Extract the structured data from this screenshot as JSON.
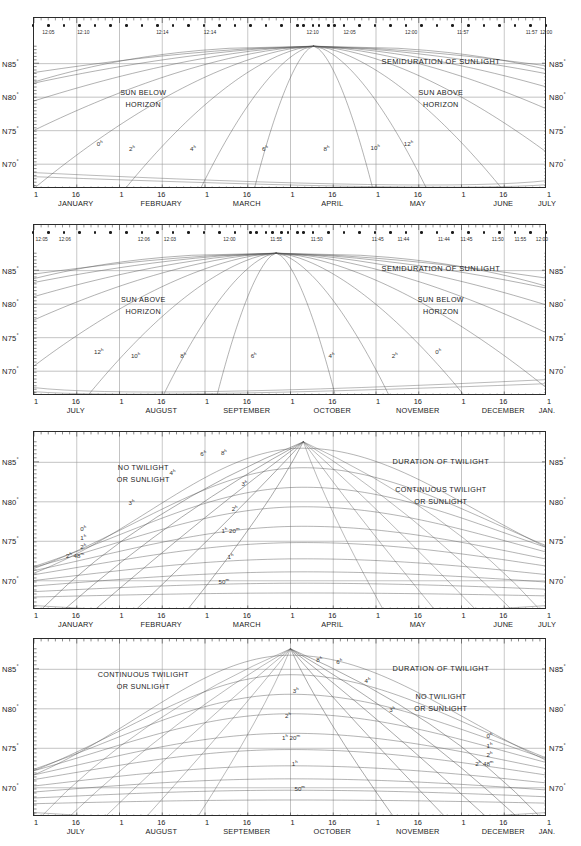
{
  "figure": {
    "width": 581,
    "height": 846,
    "background": "#ffffff",
    "line_color": "#555555",
    "axis_color": "#2b2b2b",
    "grid_color": "#9a9a9a"
  },
  "axis": {
    "y_ticks": [
      "N85",
      "N80",
      "N75",
      "N70"
    ],
    "degree_symbol": "°",
    "day_ticks": [
      "1",
      "16"
    ]
  },
  "panels": [
    {
      "id": "panel-1",
      "name": "semiduration-sunlight-jan-jul",
      "title": "SEMIDURATION OF SUNLIGHT",
      "left_region": [
        "SUN BELOW",
        "HORIZON"
      ],
      "right_region": [
        "SUN ABOVE",
        "HORIZON"
      ],
      "months": [
        "JANUARY",
        "FEBRUARY",
        "MARCH",
        "APRIL",
        "MAY",
        "JUNE"
      ],
      "end_month": "JULY",
      "time_labels": [
        {
          "text": "12:05",
          "x": 0.03
        },
        {
          "text": "12:10",
          "x": 0.098
        },
        {
          "text": "12:14",
          "x": 0.252
        },
        {
          "text": "12:14",
          "x": 0.345
        },
        {
          "text": "12:10",
          "x": 0.545
        },
        {
          "text": "12:05",
          "x": 0.617
        },
        {
          "text": "12:00",
          "x": 0.737
        },
        {
          "text": "11:57",
          "x": 0.838
        },
        {
          "text": "11:57",
          "x": 0.972
        },
        {
          "text": "12:00",
          "x": 1.06
        }
      ],
      "curve_labels": [
        {
          "text": "0",
          "sup": "h",
          "x": 0.13,
          "y": 0.735
        },
        {
          "text": "2",
          "sup": "h",
          "x": 0.193,
          "y": 0.765
        },
        {
          "text": "4",
          "sup": "h",
          "x": 0.312,
          "y": 0.765
        },
        {
          "text": "6",
          "sup": "h",
          "x": 0.452,
          "y": 0.765
        },
        {
          "text": "8",
          "sup": "h",
          "x": 0.572,
          "y": 0.765
        },
        {
          "text": "10",
          "sup": "h",
          "x": 0.667,
          "y": 0.76
        },
        {
          "text": "12",
          "sup": "h",
          "x": 0.732,
          "y": 0.735
        }
      ]
    },
    {
      "id": "panel-2",
      "name": "semiduration-sunlight-jul-jan",
      "title": "SEMIDURATION OF SUNLIGHT",
      "left_region": [
        "SUN ABOVE",
        "HORIZON"
      ],
      "right_region": [
        "SUN BELOW",
        "HORIZON"
      ],
      "months": [
        "JULY",
        "AUGUST",
        "SEPTEMBER",
        "OCTOBER",
        "NOVEMBER",
        "DECEMBER"
      ],
      "end_month": "JAN.",
      "time_labels": [
        {
          "text": "12:05",
          "x": 0.017
        },
        {
          "text": "12:06",
          "x": 0.062
        },
        {
          "text": "12:06",
          "x": 0.216
        },
        {
          "text": "12:03",
          "x": 0.267
        },
        {
          "text": "12:00",
          "x": 0.383
        },
        {
          "text": "11:55",
          "x": 0.474
        },
        {
          "text": "11:50",
          "x": 0.553
        },
        {
          "text": "11:45",
          "x": 0.672
        },
        {
          "text": "11:44",
          "x": 0.722
        },
        {
          "text": "11:44",
          "x": 0.801
        },
        {
          "text": "11:45",
          "x": 0.845
        },
        {
          "text": "11:50",
          "x": 0.906
        },
        {
          "text": "11:55",
          "x": 0.95
        },
        {
          "text": "12:00",
          "x": 0.992
        }
      ],
      "curve_labels": [
        {
          "text": "12",
          "sup": "h",
          "x": 0.128,
          "y": 0.74
        },
        {
          "text": "10",
          "sup": "h",
          "x": 0.2,
          "y": 0.765
        },
        {
          "text": "8",
          "sup": "h",
          "x": 0.293,
          "y": 0.765
        },
        {
          "text": "6",
          "sup": "h",
          "x": 0.43,
          "y": 0.765
        },
        {
          "text": "4",
          "sup": "h",
          "x": 0.582,
          "y": 0.765
        },
        {
          "text": "2",
          "sup": "h",
          "x": 0.705,
          "y": 0.765
        },
        {
          "text": "0",
          "sup": "h",
          "x": 0.79,
          "y": 0.74
        }
      ]
    },
    {
      "id": "panel-3",
      "name": "duration-twilight-jan-jul",
      "title": "DURATION OF TWILIGHT",
      "left_region": [
        "NO TWILIGHT",
        "OR SUNLIGHT"
      ],
      "right_region": [
        "CONTINUOUS TWILIGHT",
        "OR SUNLIGHT"
      ],
      "months": [
        "JANUARY",
        "FEBRUARY",
        "MARCH",
        "APRIL",
        "MAY",
        "JUNE"
      ],
      "end_month": "JULY",
      "time_labels": [],
      "curve_labels": [
        {
          "text": "6",
          "sup": "h",
          "x": 0.332,
          "y": 0.122
        },
        {
          "text": "8",
          "sup": "h",
          "x": 0.372,
          "y": 0.116
        },
        {
          "text": "4",
          "sup": "h",
          "x": 0.272,
          "y": 0.23
        },
        {
          "text": "3",
          "sup": "h",
          "x": 0.412,
          "y": 0.29
        },
        {
          "text": "3",
          "sup": "h",
          "x": 0.192,
          "y": 0.4
        },
        {
          "text": "2",
          "sup": "h",
          "x": 0.393,
          "y": 0.43
        },
        {
          "text": "1",
          "sup": "h 20m",
          "x": 0.385,
          "y": 0.555
        },
        {
          "text": "0",
          "sup": "h",
          "x": 0.098,
          "y": 0.543
        },
        {
          "text": "1",
          "sup": "h",
          "x": 0.098,
          "y": 0.597
        },
        {
          "text": "2",
          "sup": "h",
          "x": 0.098,
          "y": 0.645
        },
        {
          "text": "2",
          "sup": "h 48m",
          "x": 0.082,
          "y": 0.697
        },
        {
          "text": "1",
          "sup": "h",
          "x": 0.385,
          "y": 0.7
        },
        {
          "text": "50",
          "sup": "m",
          "x": 0.372,
          "y": 0.84
        }
      ]
    },
    {
      "id": "panel-4",
      "name": "duration-twilight-jul-jan",
      "title": "DURATION OF TWILIGHT",
      "left_region": [
        "CONTINUOUS TWILIGHT",
        "OR SUNLIGHT"
      ],
      "right_region": [
        "NO TWILIGHT",
        "OR SUNLIGHT"
      ],
      "months": [
        "JULY",
        "AUGUST",
        "SEPTEMBER",
        "OCTOBER",
        "NOVEMBER",
        "DECEMBER"
      ],
      "end_month": "JAN.",
      "time_labels": [],
      "curve_labels": [
        {
          "text": "8",
          "sup": "h",
          "x": 0.558,
          "y": 0.12
        },
        {
          "text": "6",
          "sup": "h",
          "x": 0.597,
          "y": 0.128
        },
        {
          "text": "4",
          "sup": "h",
          "x": 0.652,
          "y": 0.235
        },
        {
          "text": "3",
          "sup": "h",
          "x": 0.512,
          "y": 0.29
        },
        {
          "text": "3",
          "sup": "h",
          "x": 0.7,
          "y": 0.4
        },
        {
          "text": "2",
          "sup": "h",
          "x": 0.497,
          "y": 0.43
        },
        {
          "text": "1",
          "sup": "h 20m",
          "x": 0.503,
          "y": 0.555
        },
        {
          "text": "0",
          "sup": "h",
          "x": 0.89,
          "y": 0.545
        },
        {
          "text": "1",
          "sup": "h",
          "x": 0.89,
          "y": 0.6
        },
        {
          "text": "2",
          "sup": "h",
          "x": 0.89,
          "y": 0.65
        },
        {
          "text": "2",
          "sup": "h 48m",
          "x": 0.88,
          "y": 0.7
        },
        {
          "text": "1",
          "sup": "h",
          "x": 0.51,
          "y": 0.7
        },
        {
          "text": "50",
          "sup": "m",
          "x": 0.52,
          "y": 0.84
        }
      ]
    }
  ],
  "chart_data": {
    "type": "line",
    "xlabel": "Date (day of month)",
    "ylabel": "Latitude",
    "ylim": [
      66.5,
      87.5
    ],
    "ytick_values": [
      70,
      75,
      80,
      85
    ],
    "ytick_labels": [
      "N70°",
      "N75°",
      "N80°",
      "N85°"
    ],
    "grid": true,
    "legend": "none (curves labelled in-place)",
    "panels": [
      {
        "name": "Semiduration of sunlight, January–July",
        "x_range": [
          "Jan 1",
          "Jul 1"
        ],
        "regions": {
          "left": "SUN BELOW HORIZON",
          "right": "SUN ABOVE HORIZON"
        },
        "contour_hours": [
          0,
          2,
          4,
          6,
          8,
          10,
          12
        ],
        "contour_unit": "hours of semiduration",
        "apex": {
          "x_date": "Mar 18",
          "y_latitude": 87.5
        },
        "top_scale": {
          "name": "Local mean time of meridian transit",
          "ticks": [
            "12:05",
            "12:10",
            "12:14",
            "12:14",
            "12:10",
            "12:05",
            "12:00",
            "11:57",
            "11:57",
            "12:00"
          ]
        }
      },
      {
        "name": "Semiduration of sunlight, July–January",
        "x_range": [
          "Jul 1",
          "Jan 1"
        ],
        "regions": {
          "left": "SUN ABOVE HORIZON",
          "right": "SUN BELOW HORIZON"
        },
        "contour_hours": [
          12,
          10,
          8,
          6,
          4,
          2,
          0
        ],
        "contour_unit": "hours of semiduration",
        "apex": {
          "x_date": "Sep 25",
          "y_latitude": 87.5
        },
        "top_scale": {
          "name": "Local mean time of meridian transit",
          "ticks": [
            "12:05",
            "12:06",
            "12:06",
            "12:03",
            "12:00",
            "11:55",
            "11:50",
            "11:45",
            "11:44",
            "11:44",
            "11:45",
            "11:50",
            "11:55",
            "12:00"
          ]
        }
      },
      {
        "name": "Duration of twilight, January–July",
        "x_range": [
          "Jan 1",
          "Jul 1"
        ],
        "regions": {
          "left": "NO TWILIGHT OR SUNLIGHT",
          "right": "CONTINUOUS TWILIGHT OR SUNLIGHT"
        },
        "contour_labels": [
          "8h",
          "6h",
          "4h",
          "3h",
          "2h",
          "1h 20m",
          "1h",
          "50m",
          "0h",
          "2h 48m"
        ],
        "apex": {
          "x_date": "Mar 14",
          "y_latitude": 87.5
        }
      },
      {
        "name": "Duration of twilight, July–January",
        "x_range": [
          "Jul 1",
          "Jan 1"
        ],
        "regions": {
          "left": "CONTINUOUS TWILIGHT OR SUNLIGHT",
          "right": "NO TWILIGHT OR SUNLIGHT"
        },
        "contour_labels": [
          "8h",
          "6h",
          "4h",
          "3h",
          "2h",
          "1h 20m",
          "1h",
          "50m",
          "0h",
          "2h 48m"
        ],
        "apex": {
          "x_date": "Oct 3",
          "y_latitude": 87.5
        }
      }
    ]
  }
}
